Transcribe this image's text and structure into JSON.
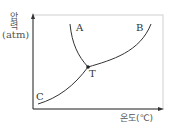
{
  "diagram": {
    "type": "phase-diagram",
    "y_axis": {
      "label": "압력",
      "unit": "(atm)"
    },
    "x_axis": {
      "label": "온도(℃)"
    },
    "curves": [
      {
        "name": "A",
        "description": "solid-liquid boundary (fusion curve), from T upward-left"
      },
      {
        "name": "B",
        "description": "liquid-gas boundary (vaporization curve), from T upward-right"
      },
      {
        "name": "C",
        "description": "solid-gas boundary (sublimation curve), from lower-left to T"
      }
    ],
    "points": [
      {
        "label": "T",
        "description": "triple point"
      }
    ],
    "labels": {
      "A": "A",
      "B": "B",
      "C": "C",
      "T": "T"
    }
  }
}
